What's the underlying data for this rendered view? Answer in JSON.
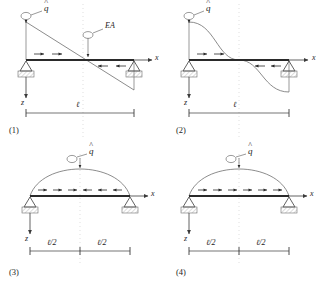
{
  "figure": {
    "stroke_color": "#3a3a3a",
    "beam_color": "#2a2a2a",
    "centerline_color": "#b9b9b9",
    "hatch_color": "#9a9a9a",
    "background": "#ffffff"
  },
  "labels": {
    "load_symbol": "q",
    "hat": "^",
    "stiffness": "EA",
    "axis_x": "x",
    "axis_z": "z",
    "span_full": "ℓ",
    "span_half": "ℓ/2"
  },
  "panels": [
    {
      "number": "(1)",
      "load_symbol": "q",
      "stiffness_label": "EA",
      "axis_x": "x",
      "axis_z": "z",
      "dimensions": [
        "ℓ"
      ],
      "load_shape": "linear-descending",
      "arrow_groups": [
        {
          "direction": "right",
          "count": 2,
          "side": "left"
        },
        {
          "direction": "left",
          "count": 2,
          "side": "right"
        }
      ],
      "support_left": "pinned",
      "support_right": "roller"
    },
    {
      "number": "(2)",
      "load_symbol": "q",
      "stiffness_label": "",
      "axis_x": "x",
      "axis_z": "z",
      "dimensions": [
        "ℓ"
      ],
      "load_shape": "cosine-s-curve",
      "arrow_groups": [
        {
          "direction": "right",
          "count": 2,
          "side": "left"
        },
        {
          "direction": "left",
          "count": 2,
          "side": "right"
        }
      ],
      "support_left": "pinned",
      "support_right": "roller"
    },
    {
      "number": "(3)",
      "load_symbol": "q",
      "stiffness_label": "",
      "axis_x": "x",
      "axis_z": "z",
      "dimensions": [
        "ℓ/2",
        "ℓ/2"
      ],
      "load_shape": "sine-arch",
      "arrow_groups": [
        {
          "direction": "right",
          "count": 3,
          "side": "left"
        },
        {
          "direction": "left",
          "count": 3,
          "side": "right"
        }
      ],
      "support_left": "pinned",
      "support_right": "roller"
    },
    {
      "number": "(4)",
      "load_symbol": "q",
      "stiffness_label": "",
      "axis_x": "x",
      "axis_z": "z",
      "dimensions": [
        "ℓ/2",
        "ℓ/2"
      ],
      "load_shape": "sine-arch",
      "arrow_groups": [
        {
          "direction": "right",
          "count": 6,
          "side": "full"
        }
      ],
      "support_left": "pinned",
      "support_right": "roller"
    }
  ]
}
